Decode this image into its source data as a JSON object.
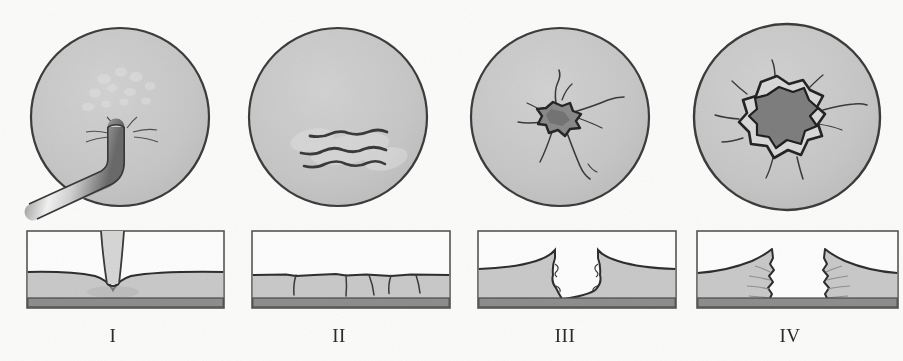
{
  "figure": {
    "background_color": "#fbfbfa",
    "surface_fill": "#c9c9c9",
    "substrate_fill": "#8e8e8e",
    "outline_color": "#2f2f2f",
    "crater_fill": "#8a8a8a",
    "panel_count": 4
  },
  "panels": [
    {
      "label": "I",
      "name": "stage-one-indentation",
      "plan_view": {
        "name": "plan-view-indentation",
        "circle_fill": "#c9c9c9",
        "circle_stroke": "#3a3a3a",
        "feature": "bent-probe-indenter",
        "feature_description": "Bent cylindrical probe pressing into the surface with radial splash marks and scattered light speckles above the contact point"
      },
      "section_view": {
        "name": "section-view-indentation",
        "feature": "plastic-dent",
        "feature_description": "Smooth bowl-shaped depression with the probe shaft entering vertically; no through-crack",
        "surface_fill": "#c9c9c9",
        "substrate_fill": "#8e8e8e"
      }
    },
    {
      "label": "II",
      "name": "stage-two-surface-cracking",
      "plan_view": {
        "name": "plan-view-scratches",
        "circle_fill": "#c9c9c9",
        "circle_stroke": "#3a3a3a",
        "feature": "parallel-scratch-lines",
        "feature_description": "Three parallel wavy scratch lines running diagonally across the field with light halo around them",
        "scratch_count": 3
      },
      "section_view": {
        "name": "section-view-surface-cracks",
        "feature": "shallow-surface-cracks",
        "feature_description": "Five shallow vertical cracks penetrating only the upper coating layer, surface remains level",
        "crack_count": 5,
        "surface_fill": "#c9c9c9",
        "substrate_fill": "#8e8e8e"
      }
    },
    {
      "label": "III",
      "name": "stage-three-deep-crater",
      "plan_view": {
        "name": "plan-view-star-crack",
        "circle_fill": "#c9c9c9",
        "circle_stroke": "#3a3a3a",
        "feature": "star-shaped-crack",
        "feature_description": "Dark irregular crater at centre with long radiating star cracks extending outward",
        "crater_fill": "#8a8a8a"
      },
      "section_view": {
        "name": "section-view-deep-crater",
        "feature": "v-shaped-crater",
        "feature_description": "Deep narrow V-shaped crater with raised lips, crack tip reaching the substrate layer",
        "surface_fill": "#c9c9c9",
        "substrate_fill": "#8e8e8e"
      }
    },
    {
      "label": "IV",
      "name": "stage-four-perforation",
      "plan_view": {
        "name": "plan-view-perforation",
        "circle_fill": "#c9c9c9",
        "circle_stroke": "#3a3a3a",
        "feature": "perforation-hole",
        "feature_description": "Large dark jagged perforation hole with spalled rim and short radial cracks",
        "crater_fill": "#8a8a8a"
      },
      "section_view": {
        "name": "section-view-perforation",
        "feature": "full-penetration",
        "feature_description": "Complete through-hole; coating torn away on both sides leaving a clear gap down to the substrate",
        "surface_fill": "#c9c9c9",
        "substrate_fill": "#8e8e8e"
      }
    }
  ]
}
